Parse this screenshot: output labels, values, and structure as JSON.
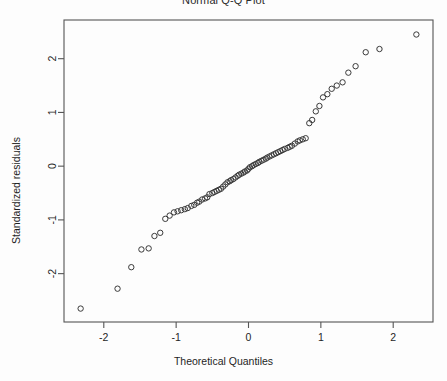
{
  "chart_data": {
    "type": "scatter",
    "title": "Normal Q-Q Plot",
    "xlabel": "Theoretical Quantiles",
    "ylabel": "Standardized residuals",
    "xlim": [
      -2.55,
      2.55
    ],
    "ylim": [
      -2.9,
      2.72
    ],
    "xticks": [
      -2,
      -1,
      0,
      1,
      2
    ],
    "xtick_labels": [
      "-2",
      "-1",
      "0",
      "1",
      "2"
    ],
    "yticks": [
      -2,
      -1,
      0,
      1,
      2
    ],
    "ytick_labels": [
      "-2",
      "-1",
      "0",
      "1",
      "2"
    ],
    "grid": false,
    "legend": null,
    "marker": "open-circle",
    "marker_color": "#3a3a3a",
    "frame_color": "#555555",
    "background": "#fdfdfd",
    "x": [
      -2.32,
      -1.81,
      -1.62,
      -1.48,
      -1.38,
      -1.3,
      -1.22,
      -1.15,
      -1.09,
      -1.03,
      -0.98,
      -0.93,
      -0.88,
      -0.84,
      -0.79,
      -0.75,
      -0.71,
      -0.68,
      -0.64,
      -0.6,
      -0.57,
      -0.54,
      -0.5,
      -0.47,
      -0.44,
      -0.41,
      -0.38,
      -0.35,
      -0.32,
      -0.29,
      -0.26,
      -0.24,
      -0.21,
      -0.18,
      -0.15,
      -0.13,
      -0.1,
      -0.07,
      -0.05,
      -0.02,
      0.0,
      0.02,
      0.05,
      0.07,
      0.1,
      0.13,
      0.15,
      0.18,
      0.21,
      0.24,
      0.26,
      0.29,
      0.32,
      0.35,
      0.38,
      0.41,
      0.44,
      0.47,
      0.5,
      0.54,
      0.57,
      0.6,
      0.64,
      0.68,
      0.71,
      0.75,
      0.79,
      0.84,
      0.88,
      0.93,
      0.98,
      1.03,
      1.09,
      1.15,
      1.22,
      1.3,
      1.38,
      1.48,
      1.62,
      1.81,
      2.32
    ],
    "y": [
      -2.65,
      -2.28,
      -1.88,
      -1.55,
      -1.53,
      -1.3,
      -1.24,
      -0.98,
      -0.92,
      -0.86,
      -0.84,
      -0.82,
      -0.8,
      -0.78,
      -0.74,
      -0.72,
      -0.68,
      -0.66,
      -0.62,
      -0.6,
      -0.58,
      -0.52,
      -0.5,
      -0.48,
      -0.46,
      -0.44,
      -0.42,
      -0.38,
      -0.34,
      -0.3,
      -0.28,
      -0.26,
      -0.24,
      -0.21,
      -0.18,
      -0.16,
      -0.14,
      -0.12,
      -0.1,
      -0.08,
      -0.05,
      -0.02,
      0.0,
      0.02,
      0.04,
      0.06,
      0.08,
      0.1,
      0.12,
      0.14,
      0.16,
      0.18,
      0.2,
      0.22,
      0.24,
      0.26,
      0.28,
      0.3,
      0.32,
      0.34,
      0.36,
      0.38,
      0.42,
      0.46,
      0.48,
      0.5,
      0.52,
      0.8,
      0.86,
      1.02,
      1.12,
      1.28,
      1.34,
      1.44,
      1.5,
      1.56,
      1.74,
      1.86,
      2.12,
      2.18,
      2.45
    ]
  },
  "axis": {
    "x_label": "Theoretical Quantiles",
    "y_label": "Standardized residuals"
  },
  "title": "Normal Q-Q Plot"
}
